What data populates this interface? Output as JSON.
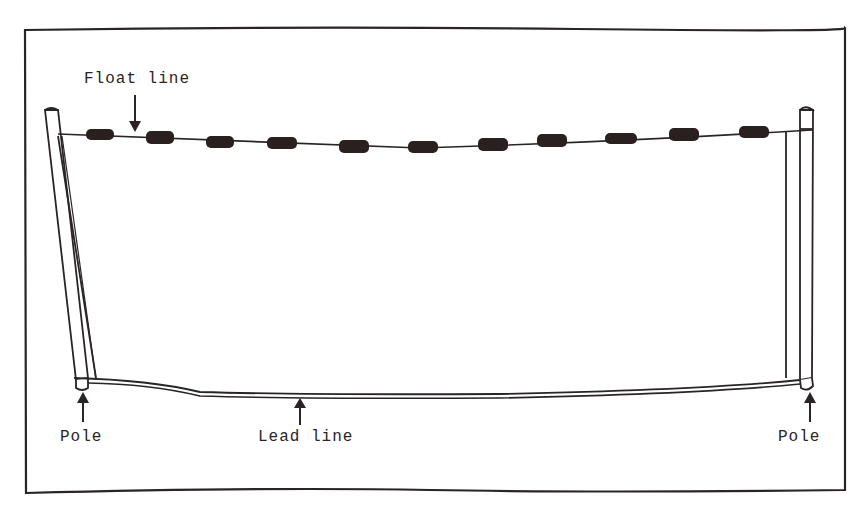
{
  "diagram": {
    "type": "seine-net-illustration",
    "labels": {
      "float_line": "Float line",
      "lead_line": "Lead line",
      "pole_left": "Pole",
      "pole_right": "Pole"
    },
    "colors": {
      "ink": "#2a2424",
      "float": "#2b2020",
      "background": "#ffffff"
    },
    "float_count": 12
  }
}
